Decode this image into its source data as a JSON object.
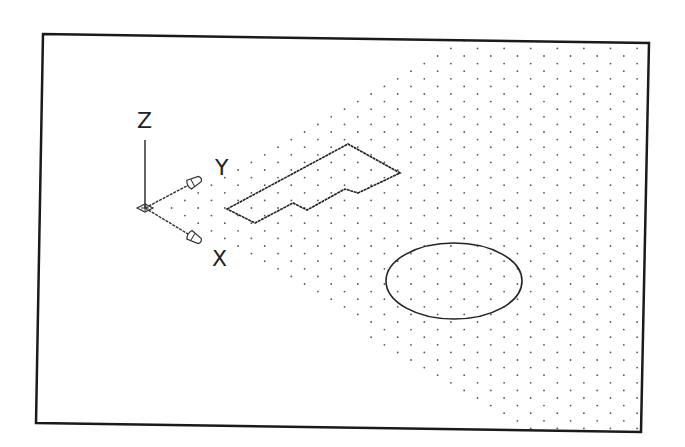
{
  "viewport": {
    "background": "#ffffff",
    "frame": {
      "color": "#1a1a1a",
      "stroke_width": 2.5,
      "corners": [
        [
          43,
          34
        ],
        [
          649,
          43
        ],
        [
          641,
          432
        ],
        [
          36,
          423
        ]
      ]
    },
    "grid": {
      "dot_color": "#555555",
      "dot_radius": 0.9,
      "origin": [
        145,
        208
      ],
      "u": [
        13.3,
        -7.6
      ],
      "v": [
        13.3,
        7.6
      ],
      "region_upper": [
        [
          208,
          182
        ],
        [
          460,
          36
        ]
      ],
      "region_lower": [
        [
          180,
          214
        ],
        [
          510,
          428
        ]
      ]
    }
  },
  "ucs_icon": {
    "origin": [
      145,
      208
    ],
    "z_end": [
      145,
      140
    ],
    "y_end": [
      198,
      180
    ],
    "x_end": [
      198,
      240
    ],
    "labels": {
      "z": "Z",
      "y": "Y",
      "x": "X"
    },
    "label_positions": {
      "z": [
        137,
        128
      ],
      "y": [
        215,
        175
      ],
      "x": [
        212,
        266
      ]
    }
  },
  "objects": {
    "polyline": {
      "name": "closed-polyline",
      "points": [
        [
          227,
          209
        ],
        [
          348,
          144
        ],
        [
          400,
          173
        ],
        [
          358,
          193
        ],
        [
          345,
          189
        ],
        [
          307,
          210
        ],
        [
          293,
          203
        ],
        [
          255,
          223
        ]
      ]
    },
    "ellipse": {
      "name": "ellipse",
      "cx": 454,
      "cy": 281,
      "rx": 68,
      "ry": 38
    },
    "stroke_color": "#222222"
  }
}
